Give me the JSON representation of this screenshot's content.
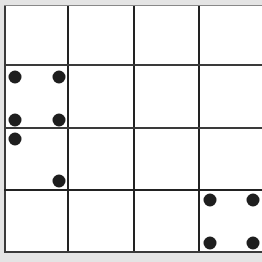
{
  "board": {
    "rows": 4,
    "cols": 4,
    "col_lines_x": [
      4,
      68,
      134,
      199
    ],
    "row_lines_y": [
      5,
      65,
      128,
      190,
      252
    ],
    "colors": {
      "background": "#e4e4e4",
      "board": "#ffffff",
      "line": "#3a3a3a",
      "dot": "#1e1e1e"
    },
    "cells_with_dots": [
      {
        "row": 1,
        "col": 0,
        "dots": 4,
        "pattern": "four-corners"
      },
      {
        "row": 2,
        "col": 0,
        "dots": 2,
        "pattern": "diagonal"
      },
      {
        "row": 3,
        "col": 3,
        "dots": 4,
        "pattern": "four-corners"
      }
    ],
    "dots": [
      {
        "x": 15,
        "y": 77
      },
      {
        "x": 59,
        "y": 77
      },
      {
        "x": 15,
        "y": 120
      },
      {
        "x": 59,
        "y": 120
      },
      {
        "x": 15,
        "y": 139
      },
      {
        "x": 59,
        "y": 181
      },
      {
        "x": 210,
        "y": 200
      },
      {
        "x": 253,
        "y": 200
      },
      {
        "x": 210,
        "y": 243
      },
      {
        "x": 253,
        "y": 243
      }
    ]
  }
}
